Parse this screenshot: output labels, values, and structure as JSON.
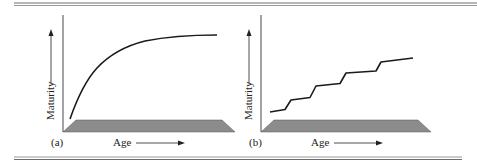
{
  "figure": {
    "panels": [
      {
        "id": "a",
        "tag": "(a)",
        "y_label": "Maturity",
        "x_label": "Age",
        "curve_type": "continuous-saturating"
      },
      {
        "id": "b",
        "tag": "(b)",
        "y_label": "Maturity",
        "x_label": "Age",
        "curve_type": "stepwise"
      }
    ]
  },
  "colors": {
    "line": "#1a1a1a",
    "base_fill": "#8c8c8c",
    "rule": "#6e6e6e",
    "text": "#222222"
  }
}
